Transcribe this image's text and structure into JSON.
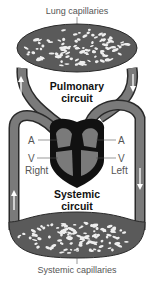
{
  "diagram": {
    "labels": {
      "lung_capillaries": "Lung capillaries",
      "pulmonary_circuit_line1": "Pulmonary",
      "pulmonary_circuit_line2": "circuit",
      "systemic_circuit_line1": "Systemic",
      "systemic_circuit_line2": "circuit",
      "systemic_capillaries": "Systemic capillaries",
      "right_atrium": "A",
      "right_ventricle": "V",
      "left_atrium": "A",
      "left_ventricle": "V",
      "right_side": "Right",
      "left_side": "Left"
    },
    "colors": {
      "vessel": "#6e6e6e",
      "vessel_dark": "#2a2a2a",
      "heart_outline": "#111111",
      "heart_chamber": "#7a7a7a",
      "capillary_bed": "#5a5a5a",
      "arrow": "#ffffff"
    },
    "flow_arrows": [
      {
        "location": "pulmonary-left",
        "direction": "up"
      },
      {
        "location": "pulmonary-right",
        "direction": "down"
      },
      {
        "location": "systemic-left",
        "direction": "up"
      },
      {
        "location": "systemic-right",
        "direction": "down"
      }
    ]
  }
}
